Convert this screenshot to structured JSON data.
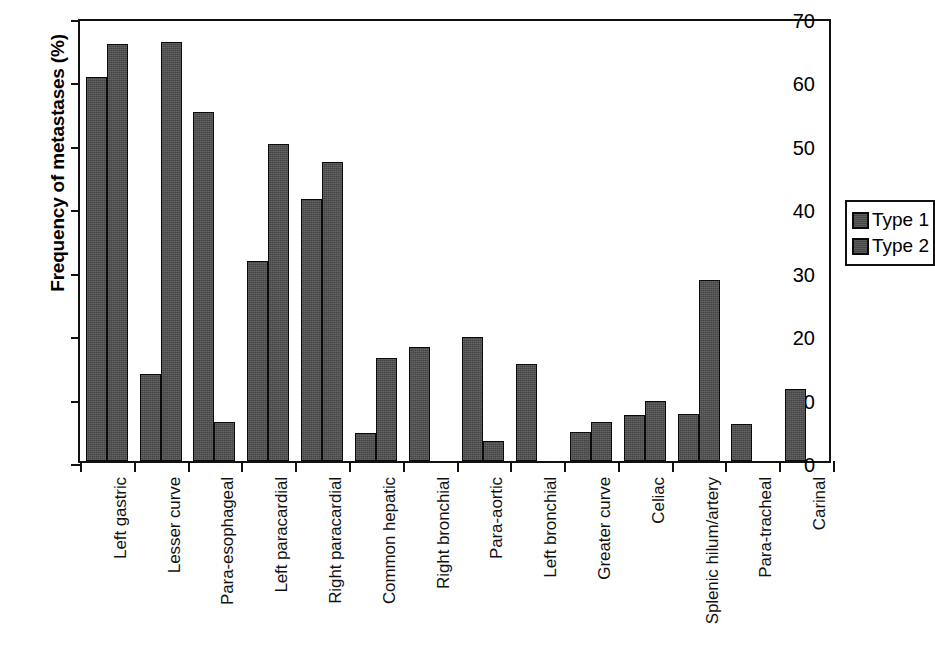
{
  "chart_data": {
    "type": "bar",
    "title": "",
    "xlabel": "",
    "ylabel": "Frequency of metastases (%)",
    "ylim": [
      0,
      70
    ],
    "ytick_values": [
      0,
      10,
      20,
      30,
      40,
      50,
      60,
      70
    ],
    "ytick_labels": [
      "0",
      "10",
      "20",
      "30",
      "40",
      "50",
      "60",
      "70"
    ],
    "grid": false,
    "legend_position": "right",
    "bar_color": "#4e4e4e",
    "bar_edge_color": "#0a0a0a",
    "categories": [
      "Left gastric",
      "Lesser curve",
      "Para-esophageal",
      "Left paracardial",
      "Right paracardial",
      "Common hepatic",
      "Right bronchial",
      "Para-aortic",
      "Left bronchial",
      "Greater curve",
      "Celiac",
      "Splenic hilum/artery",
      "Para-tracheal",
      "Carinal"
    ],
    "series": [
      {
        "name": "Type 1",
        "values": [
          60.5,
          13.7,
          55.0,
          31.6,
          41.3,
          4.4,
          18.0,
          19.5,
          15.3,
          4.6,
          7.2,
          7.4,
          5.8,
          11.3
        ]
      },
      {
        "name": "Type 2",
        "values": [
          65.8,
          66.0,
          6.1,
          50.0,
          47.1,
          16.2,
          0,
          3.1,
          0,
          6.2,
          9.4,
          28.5,
          0,
          0
        ]
      }
    ]
  },
  "legend": {
    "entries": [
      {
        "label": "Type 1",
        "swatch": "legend-swatch-type-1"
      },
      {
        "label": "Type 2",
        "swatch": "legend-swatch-type-2"
      }
    ]
  }
}
